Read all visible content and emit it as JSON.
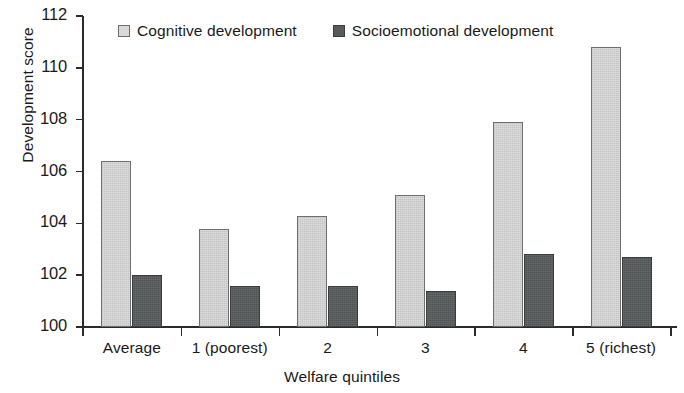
{
  "chart_data": {
    "type": "bar",
    "title": "",
    "xlabel": "Welfare quintiles",
    "ylabel": "Development score",
    "categories": [
      "Average",
      "1 (poorest)",
      "2",
      "3",
      "4",
      "5 (richest)"
    ],
    "series": [
      {
        "name": "Cognitive development",
        "color": "#d9d9d9",
        "values": [
          106.4,
          103.8,
          104.3,
          105.1,
          107.9,
          110.8
        ]
      },
      {
        "name": "Socioemotional development",
        "color": "#565b5b",
        "values": [
          102.0,
          101.6,
          101.6,
          101.4,
          102.8,
          102.7
        ]
      }
    ],
    "ylim": [
      100,
      112
    ],
    "yticks": [
      100,
      102,
      104,
      106,
      108,
      110,
      112
    ],
    "ytick_labels": [
      "100",
      "102",
      "104",
      "106",
      "108",
      "110",
      "112"
    ],
    "grid": false,
    "legend_position": "top-center"
  },
  "legend": {
    "items": [
      {
        "label": "Cognitive development",
        "swatch": "cognitive-swatch"
      },
      {
        "label": "Socioemotional development",
        "swatch": "socioemotional-swatch"
      }
    ]
  }
}
